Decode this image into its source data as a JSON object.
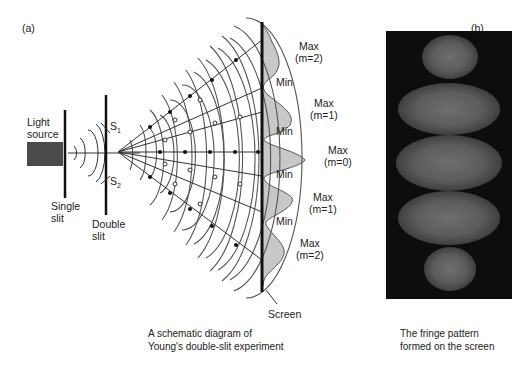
{
  "panel_a": {
    "label": "(a)",
    "light_source": [
      "Light",
      "source"
    ],
    "single_slit": [
      "Single",
      "slit"
    ],
    "double_slit": [
      "Double",
      "slit"
    ],
    "s1": "S",
    "s1_sub": "1",
    "s2": "S",
    "s2_sub": "2",
    "screen": "Screen",
    "fringes": [
      {
        "type": "Max",
        "order": "(m=2)"
      },
      {
        "type": "Min"
      },
      {
        "type": "Max",
        "order": "(m=1)"
      },
      {
        "type": "Min"
      },
      {
        "type": "Max",
        "order": "(m=0)"
      },
      {
        "type": "Min"
      },
      {
        "type": "Max",
        "order": "(m=1)"
      },
      {
        "type": "Min"
      },
      {
        "type": "Max",
        "order": "(m=2)"
      }
    ],
    "caption": [
      "A schematic diagram of",
      "Young's double-slit experiment"
    ]
  },
  "panel_b": {
    "label": "(b)",
    "caption": [
      "The fringe pattern",
      "formed on the screen"
    ]
  },
  "colors": {
    "ink": "#222222",
    "wave": "#555555",
    "source_box": "#4a4a4a",
    "intensity_fill": "#c8c8c8",
    "fringe_bg": "#0d0d0d",
    "fringe_bright": "#6e6e6e"
  }
}
